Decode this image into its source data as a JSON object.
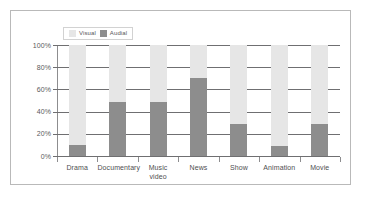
{
  "chart_data": {
    "type": "bar",
    "subtype": "stacked-percent",
    "title": "",
    "xlabel": "",
    "ylabel": "",
    "ylim": [
      0,
      100
    ],
    "ytick_labels": [
      "100%",
      "80%",
      "60%",
      "40%",
      "20%",
      "0%"
    ],
    "ytick_values": [
      100,
      80,
      60,
      40,
      20,
      0
    ],
    "grid": true,
    "legend_position": "top-left",
    "categories": [
      "Drama",
      "Documentary",
      "Music\nvideo",
      "News",
      "Show",
      "Animation",
      "Movie"
    ],
    "series": [
      {
        "name": "Visual",
        "color": "#e6e6e6",
        "values": [
          90,
          51,
          51,
          30,
          71,
          91,
          71
        ]
      },
      {
        "name": "Audial",
        "color": "#8d8d8d",
        "values": [
          10,
          49,
          49,
          70,
          29,
          9,
          29
        ]
      }
    ]
  },
  "legend": {
    "items": [
      {
        "label": "Visual",
        "color": "#e6e6e6"
      },
      {
        "label": "Audial",
        "color": "#8d8d8d"
      }
    ]
  },
  "axis": {
    "y_labels": [
      "100%",
      "80%",
      "60%",
      "40%",
      "20%",
      "0%"
    ],
    "x_labels": [
      "Drama",
      "Documentary",
      "Music\nvideo",
      "News",
      "Show",
      "Animation",
      "Movie"
    ]
  }
}
